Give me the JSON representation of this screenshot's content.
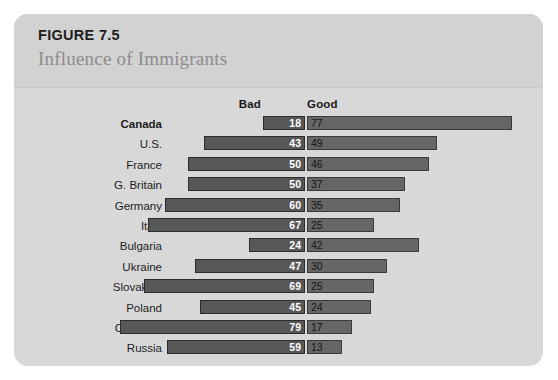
{
  "figure": {
    "number": "FIGURE 7.5",
    "title": "Influence of Immigrants"
  },
  "axis": {
    "left_header": "Bad",
    "right_header": "Good"
  },
  "colors": {
    "card_background": "#d8d8d8",
    "header_background": "#d2d2d2",
    "bad_bar": "#575757",
    "good_bar": "#666666",
    "figure_number_text": "#1d1d1d",
    "figure_title_text": "#8d8d8d"
  },
  "chart_data": {
    "type": "bar",
    "title": "Influence of Immigrants",
    "subtype": "diverging-horizontal",
    "xlabel": "",
    "ylabel": "",
    "categories": [
      "Canada",
      "U.S.",
      "France",
      "G. Britain",
      "Germany",
      "Italy",
      "Bulgaria",
      "Ukraine",
      "Slovak R.",
      "Poland",
      "Czech R.",
      "Russia"
    ],
    "series": [
      {
        "name": "Bad",
        "direction": "left",
        "values": [
          18,
          43,
          50,
          50,
          60,
          67,
          24,
          47,
          69,
          45,
          79,
          59
        ]
      },
      {
        "name": "Good",
        "direction": "right",
        "values": [
          77,
          49,
          46,
          37,
          35,
          25,
          42,
          30,
          25,
          24,
          17,
          13
        ]
      }
    ],
    "xlim": [
      0,
      80
    ],
    "grid": false,
    "legend": "top-center-as-column-headers",
    "highlighted_category": "Canada",
    "rows": [
      {
        "label": "Canada",
        "bad": 18,
        "good": 77,
        "highlight": true
      },
      {
        "label": "U.S.",
        "bad": 43,
        "good": 49,
        "highlight": false
      },
      {
        "label": "France",
        "bad": 50,
        "good": 46,
        "highlight": false
      },
      {
        "label": "G. Britain",
        "bad": 50,
        "good": 37,
        "highlight": false
      },
      {
        "label": "Germany",
        "bad": 60,
        "good": 35,
        "highlight": false
      },
      {
        "label": "Italy",
        "bad": 67,
        "good": 25,
        "highlight": false
      },
      {
        "label": "Bulgaria",
        "bad": 24,
        "good": 42,
        "highlight": false
      },
      {
        "label": "Ukraine",
        "bad": 47,
        "good": 30,
        "highlight": false
      },
      {
        "label": "Slovak R.",
        "bad": 69,
        "good": 25,
        "highlight": false
      },
      {
        "label": "Poland",
        "bad": 45,
        "good": 24,
        "highlight": false
      },
      {
        "label": "Czech R.",
        "bad": 79,
        "good": 17,
        "highlight": false
      },
      {
        "label": "Russia",
        "bad": 59,
        "good": 13,
        "highlight": false
      }
    ]
  }
}
